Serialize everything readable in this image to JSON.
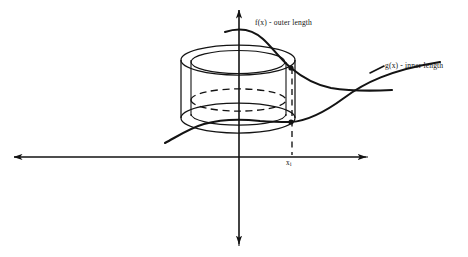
{
  "figure": {
    "kind": "hand-drawn calculus diagram",
    "background_color": "#ffffff",
    "ink_color": "#131313",
    "width": 468,
    "height": 257
  },
  "labels": {
    "outer_curve": "f(x) - outer length",
    "inner_curve": "g(x) - inner length",
    "x_tick_base": "x",
    "x_tick_sub": "i"
  },
  "axes": {
    "x_axis": {
      "y": 157,
      "x_start": 12,
      "x_end": 368,
      "arrow_left": true,
      "arrow_right": true
    },
    "y_axis": {
      "x": 239,
      "y_start": 8,
      "y_end": 246,
      "arrow_top": true,
      "arrow_bottom": true
    },
    "tick": {
      "x": 292,
      "label": "x_i"
    }
  },
  "shell": {
    "center_x": 238,
    "top_y": 60,
    "bottom_y": 118,
    "outer_rx": 57,
    "outer_ry": 15,
    "inner_rx": 47,
    "inner_ry": 11,
    "hidden_ellipse_y": 100,
    "hidden_style": "dashed"
  },
  "curves": {
    "f": {
      "name": "f(x)",
      "description": "outer length curve, enters upper-left, arcs over and descends steeply then flattens right",
      "start": [
        225,
        32
      ],
      "end": [
        390,
        90
      ]
    },
    "g": {
      "name": "g(x)",
      "description": "inner length curve, rises from lower-left through shell bottom to upper-right",
      "start": [
        165,
        143
      ],
      "end": [
        440,
        62
      ]
    }
  },
  "dashed_drop_line": {
    "x": 292,
    "y_top": 68,
    "y_bottom": 155
  },
  "markers": [
    {
      "name": "f-intersection-dot",
      "x": 291,
      "y": 68
    },
    {
      "name": "g-intersection-dot",
      "x": 291,
      "y": 122
    }
  ]
}
